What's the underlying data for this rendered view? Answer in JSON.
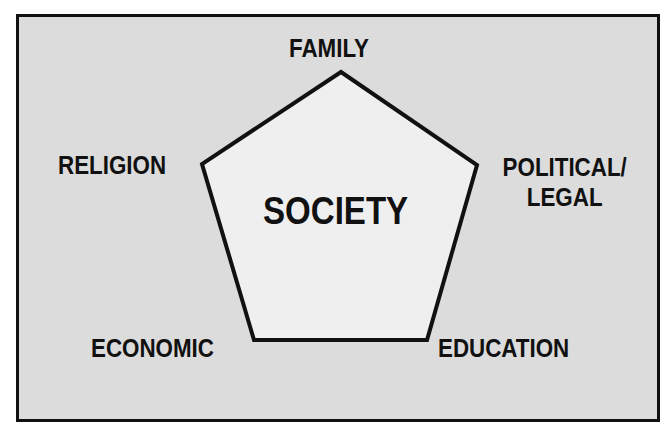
{
  "diagram": {
    "center_label": "SOCIETY",
    "nodes": [
      {
        "id": "family",
        "label": "FAMILY"
      },
      {
        "id": "religion",
        "label": "RELIGION"
      },
      {
        "id": "political",
        "label_line1": "POLITICAL/",
        "label_line2": "LEGAL"
      },
      {
        "id": "economic",
        "label": "ECONOMIC"
      },
      {
        "id": "education",
        "label": "EDUCATION"
      }
    ],
    "colors": {
      "background": "#dcdcdc",
      "shape_fill": "#efefef",
      "stroke": "#111111",
      "text": "#111111"
    }
  }
}
